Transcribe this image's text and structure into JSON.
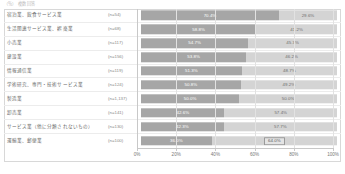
{
  "top_caption": "（％）　複数回答",
  "chart_data": {
    "type": "bar",
    "subtype": "stacked-horizontal-100",
    "title": "",
    "xlabel": "",
    "ylabel": "",
    "xlim": [
      0,
      100
    ],
    "grid": true,
    "legend_position": "none",
    "colors": {
      "series_a": "#a6a6a6",
      "series_b": "#d4d4d4",
      "frame": "#d8d8d8",
      "gridline": "#e2e2e2",
      "text": "#6a6a6a"
    },
    "axis": {
      "ticks": [
        0,
        20,
        40,
        60,
        80,
        100
      ],
      "tick_labels": [
        "0%",
        "20%",
        "40%",
        "60%",
        "80%",
        "100%"
      ]
    },
    "categories": [
      "宿泊業、飲食サービス業",
      "生活関連サービス業、娯楽業",
      "小売業",
      "建設業",
      "情報通信業",
      "学術研究、専門・技術サービス業",
      "製造業",
      "卸売業",
      "サービス業（他に分類されないもの）",
      "運輸業、郵便業"
    ],
    "sample_sizes": [
      "(n=54)",
      "(n=68)",
      "(n=117)",
      "(n=156)",
      "(n=119)",
      "(n=124)",
      "(n=1,137)",
      "(n=141)",
      "(n=130)",
      "(n=100)"
    ],
    "series": [
      {
        "name": "series_a",
        "values": [
          70.4,
          58.8,
          54.7,
          53.8,
          51.3,
          50.8,
          50.0,
          42.6,
          42.3,
          36.0
        ],
        "labels": [
          "70.4%",
          "58.8%",
          "54.7%",
          "53.8%",
          "51.3%",
          "50.8%",
          "50.0%",
          "42.6%",
          "42.3%",
          "36.0%"
        ]
      },
      {
        "name": "series_b",
        "values": [
          29.6,
          41.2,
          45.3,
          46.2,
          48.7,
          49.2,
          50.0,
          57.4,
          57.7,
          64.0
        ],
        "labels": [
          "29.6%",
          "41.2%",
          "45.3%",
          "46.2%",
          "48.7%",
          "49.2%",
          "50.0%",
          "57.4%",
          "57.7%",
          "64.0%"
        ]
      }
    ],
    "highlighted_label": "64.0%"
  }
}
